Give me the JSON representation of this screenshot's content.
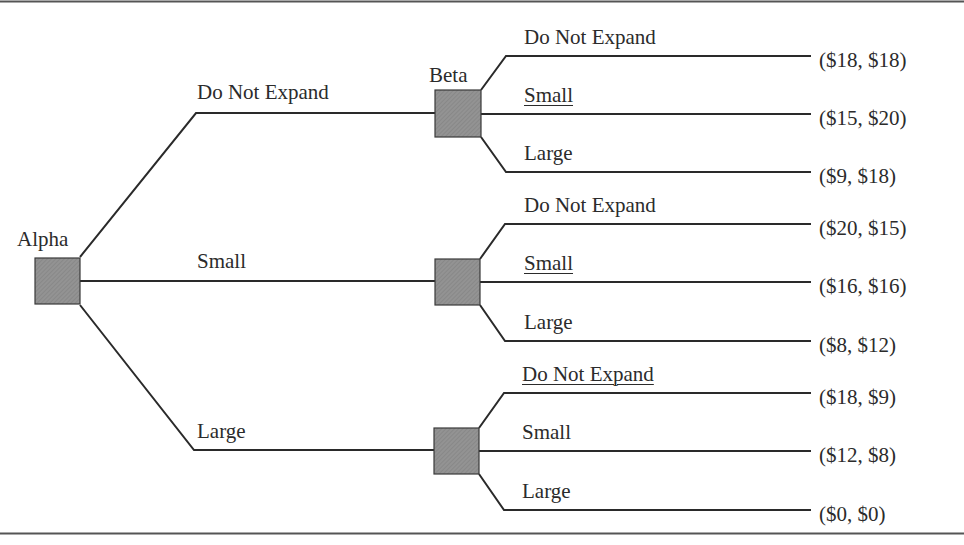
{
  "diagram": {
    "type": "game-tree",
    "players": {
      "first": "Alpha",
      "second": "Beta"
    },
    "alpha_moves": [
      {
        "label": "Do Not Expand",
        "underlined": false
      },
      {
        "label": "Small",
        "underlined": false
      },
      {
        "label": "Large",
        "underlined": false
      }
    ],
    "subtrees": [
      {
        "node_label": "Beta",
        "branches": [
          {
            "label": "Do Not Expand",
            "underlined": false,
            "payoff": "($18, $18)"
          },
          {
            "label": "Small",
            "underlined": true,
            "payoff": "($15, $20)"
          },
          {
            "label": "Large",
            "underlined": false,
            "payoff": "($9, $18)"
          }
        ]
      },
      {
        "node_label": "",
        "branches": [
          {
            "label": "Do Not Expand",
            "underlined": false,
            "payoff": "($20, $15)"
          },
          {
            "label": "Small",
            "underlined": true,
            "payoff": "($16, $16)"
          },
          {
            "label": "Large",
            "underlined": false,
            "payoff": "($8, $12)"
          }
        ]
      },
      {
        "node_label": "",
        "branches": [
          {
            "label": "Do Not Expand",
            "underlined": true,
            "payoff": "($18, $9)"
          },
          {
            "label": "Small",
            "underlined": false,
            "payoff": "($12, $8)"
          },
          {
            "label": "Large",
            "underlined": false,
            "payoff": "($0, $0)"
          }
        ]
      }
    ],
    "colors": {
      "node_fill": "#8f8f8f",
      "line": "#2a2a2a",
      "rule": "#555555"
    }
  }
}
